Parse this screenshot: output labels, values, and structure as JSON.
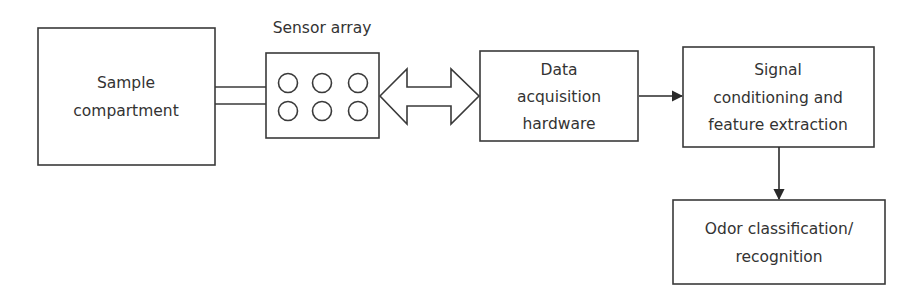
{
  "diagram": {
    "colors": {
      "stroke": "#3a3a3a",
      "fill": "#ffffff",
      "text": "#333333"
    },
    "nodes": [
      {
        "id": "sample",
        "lines": [
          "Sample",
          "compartment"
        ]
      },
      {
        "id": "sensor",
        "label": "Sensor array",
        "sensor_count": 6
      },
      {
        "id": "daq",
        "lines": [
          "Data",
          "acquisition",
          "hardware"
        ]
      },
      {
        "id": "signal",
        "lines": [
          "Signal",
          "conditioning and",
          "feature extraction"
        ]
      },
      {
        "id": "odor",
        "lines": [
          "Odor classification/",
          "recognition"
        ]
      }
    ],
    "edges": [
      {
        "from": "sample",
        "to": "sensor",
        "type": "pipe"
      },
      {
        "from": "sensor",
        "to": "daq",
        "type": "bidirectional-block-arrow"
      },
      {
        "from": "daq",
        "to": "signal",
        "type": "arrow"
      },
      {
        "from": "signal",
        "to": "odor",
        "type": "arrow"
      }
    ]
  }
}
